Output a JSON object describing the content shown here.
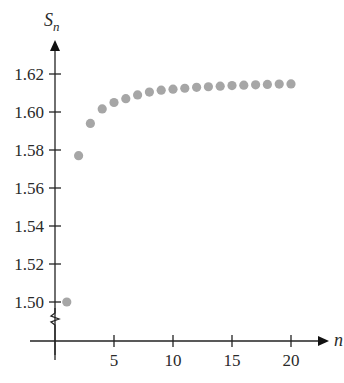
{
  "chart_data": {
    "type": "scatter",
    "title": "",
    "xlabel": "n",
    "ylabel": "S_n",
    "ylabel_main": "S",
    "ylabel_sub": "n",
    "xlim": [
      0,
      22
    ],
    "ylim": [
      1.49,
      1.63
    ],
    "y_axis_break": true,
    "grid": false,
    "legend": null,
    "x_ticks": [
      5,
      10,
      15,
      20
    ],
    "x_tick_labels": [
      "5",
      "10",
      "15",
      "20"
    ],
    "y_ticks": [
      1.5,
      1.52,
      1.54,
      1.56,
      1.58,
      1.6,
      1.62
    ],
    "y_tick_labels": [
      "1.50",
      "1.52",
      "1.54",
      "1.56",
      "1.58",
      "1.60",
      "1.62"
    ],
    "marker_color": "#a6a6a6",
    "series": [
      {
        "name": "S_n",
        "x": [
          1,
          2,
          3,
          4,
          5,
          6,
          7,
          8,
          9,
          10,
          11,
          12,
          13,
          14,
          15,
          16,
          17,
          18,
          19,
          20
        ],
        "values": [
          1.5,
          1.577,
          1.594,
          1.6016,
          1.605,
          1.607,
          1.609,
          1.6105,
          1.6115,
          1.612,
          1.6125,
          1.613,
          1.6133,
          1.6136,
          1.6139,
          1.6141,
          1.6143,
          1.6145,
          1.6147,
          1.6148
        ]
      }
    ]
  }
}
